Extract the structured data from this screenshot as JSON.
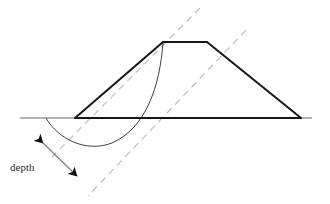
{
  "figure": {
    "labels": {
      "depth": "depth"
    },
    "colors": {
      "embankment_outline": "#1a1a1a",
      "ground_line": "#555555",
      "slip_arc": "#3a3a3a",
      "dashed_construction": "#b9b9b9",
      "dimension_line": "#6d6d6d",
      "arrowhead": "#111111",
      "text": "#2b2b2b",
      "background": "#ffffff"
    },
    "geometry": {
      "ground_line": {
        "x1": 20,
        "y1": 118,
        "x2": 312,
        "y2": 118
      },
      "embankment": {
        "left_toe": {
          "x": 75,
          "y": 118
        },
        "crest_left": {
          "x": 163,
          "y": 42
        },
        "crest_right": {
          "x": 207,
          "y": 42
        },
        "right_toe": {
          "x": 301,
          "y": 118
        },
        "base_line": {
          "x1": 75,
          "y1": 118,
          "x2": 301,
          "y2": 118
        }
      },
      "slip_arc": {
        "start": {
          "x": 163,
          "y": 42
        },
        "end": {
          "x": 46,
          "y": 118
        },
        "lowest_point": {
          "x": 107,
          "y": 144
        },
        "description": "circular failure surface from crest corner curving below ground line"
      },
      "dashed_line_upper": {
        "x1": 200,
        "y1": 8,
        "x2": 52,
        "y2": 157
      },
      "dashed_line_lower": {
        "x1": 246,
        "y1": 30,
        "x2": 88,
        "y2": 196
      },
      "dimension": {
        "arrow_start": {
          "x": 43,
          "y": 143
        },
        "arrow_end": {
          "x": 77,
          "y": 176
        },
        "double_headed": true
      },
      "depth_label_position": {
        "x": 10,
        "y": 171
      }
    }
  }
}
